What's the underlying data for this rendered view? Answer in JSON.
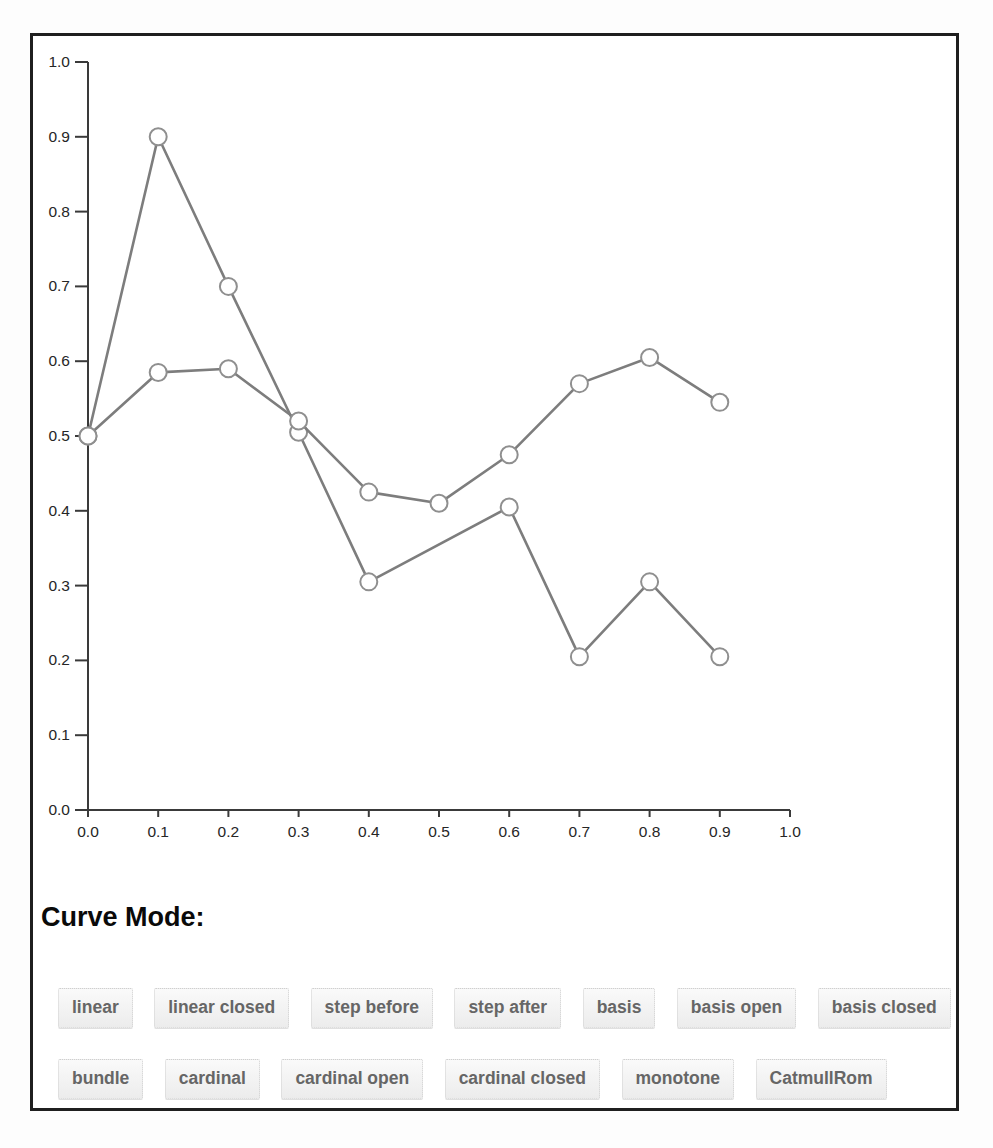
{
  "heading": {
    "curve_mode_label": "Curve Mode:"
  },
  "buttons": {
    "row1": [
      "linear",
      "linear closed",
      "step before",
      "step after",
      "basis",
      "basis open",
      "basis closed"
    ],
    "row2": [
      "bundle",
      "cardinal",
      "cardinal open",
      "cardinal closed",
      "monotone",
      "CatmullRom"
    ]
  },
  "style": {
    "line_color": "#7d7d7d",
    "marker_fill": "#ffffff",
    "marker_stroke": "#8f8f8f",
    "axis_color": "#3a3a3a",
    "tick_label_color": "#262626",
    "button_text_color": "#666666",
    "frame_border_color": "#1f1f1f"
  },
  "chart_data": {
    "type": "line",
    "title": "",
    "xlabel": "",
    "ylabel": "",
    "xlim": [
      0.0,
      1.0
    ],
    "ylim": [
      0.0,
      1.0
    ],
    "x_ticks": [
      0.0,
      0.1,
      0.2,
      0.3,
      0.4,
      0.5,
      0.6,
      0.7,
      0.8,
      0.9,
      1.0
    ],
    "y_ticks": [
      0.0,
      0.1,
      0.2,
      0.3,
      0.4,
      0.5,
      0.6,
      0.7,
      0.8,
      0.9,
      1.0
    ],
    "tick_label_format": "one_decimal",
    "grid": false,
    "legend": "none",
    "marker": "open-circle",
    "current_curve_mode": "linear",
    "series": [
      {
        "name": "series-1",
        "x": [
          0.0,
          0.1,
          0.2,
          0.3,
          0.4,
          0.6,
          0.7,
          0.8,
          0.9
        ],
        "y": [
          0.5,
          0.9,
          0.7,
          0.505,
          0.305,
          0.405,
          0.205,
          0.305,
          0.205
        ]
      },
      {
        "name": "series-2",
        "x": [
          0.0,
          0.1,
          0.2,
          0.3,
          0.4,
          0.5,
          0.6,
          0.7,
          0.8,
          0.9
        ],
        "y": [
          0.5,
          0.585,
          0.59,
          0.52,
          0.425,
          0.41,
          0.475,
          0.57,
          0.605,
          0.545
        ]
      }
    ]
  }
}
